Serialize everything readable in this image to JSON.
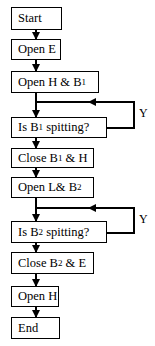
{
  "flowchart": {
    "steps": [
      {
        "id": "start",
        "text": "Start",
        "type": "terminal"
      },
      {
        "id": "open_e",
        "text": "Open E",
        "type": "process"
      },
      {
        "id": "open_h_b1",
        "text": "Open H & B",
        "sub": "1",
        "type": "process"
      },
      {
        "id": "is_b1_spitting",
        "text": "Is B",
        "sub": "1",
        "text_after": " spitting?",
        "type": "decision"
      },
      {
        "id": "close_b1_h",
        "text": "Close B",
        "sub": "1",
        "text_after": " & H",
        "type": "process"
      },
      {
        "id": "open_l_b2",
        "text": "Open L& B",
        "sub": "2",
        "type": "process"
      },
      {
        "id": "is_b2_spitting",
        "text": "Is B",
        "sub": "2",
        "text_after": " spitting?",
        "type": "decision"
      },
      {
        "id": "close_b2_e",
        "text": "Close B",
        "sub": "2",
        "text_after": " & E",
        "type": "process"
      },
      {
        "id": "open_h",
        "text": "Open H",
        "type": "process"
      },
      {
        "id": "end",
        "text": "End",
        "type": "terminal"
      }
    ],
    "loops": [
      {
        "from": "is_b1_spitting",
        "to": "is_b1_spitting",
        "label": "Y"
      },
      {
        "from": "is_b2_spitting",
        "to": "is_b2_spitting",
        "label": "Y"
      }
    ]
  }
}
